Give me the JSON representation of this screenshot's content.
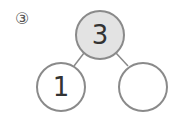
{
  "problem_label": "③",
  "number_bond": {
    "whole": "3",
    "part_left": "1",
    "part_right": ""
  },
  "colors": {
    "whole_fill": "#e3e3e3",
    "stroke": "#8a8a8a",
    "part_fill": "#ffffff"
  }
}
